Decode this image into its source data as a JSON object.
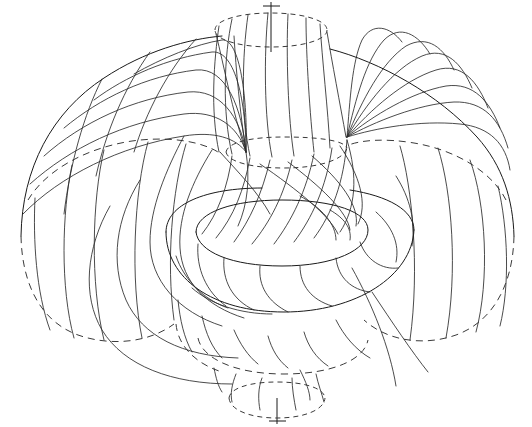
{
  "figure": {
    "kind": "mathematical-line-diagram",
    "background_color": "#ffffff",
    "line_color": "#1a1a1a",
    "dashed_line_color": "#3a3a3a",
    "canvas": {
      "width": 532,
      "height": 427
    },
    "caption": "",
    "labels": [],
    "axis": {
      "name": "axis-of-revolution",
      "orientation": "vertical",
      "x": 271,
      "top_y": 2,
      "top_end_y": 52,
      "bottom_y": 398,
      "bottom_end_y": 424,
      "tick_top": {
        "x1": 262,
        "y1": 6,
        "x2": 281,
        "y2": 6
      },
      "tick_bottom": {
        "x1": 262,
        "y1": 421,
        "x2": 281,
        "y2": 421
      }
    },
    "outer_silhouette": {
      "name": "outer-torus-outline",
      "left_extent_x": 20,
      "right_extent_x": 515,
      "top_extent_y": 14,
      "bottom_extent_y": 414,
      "solid_top_arc": "M 24 233 C 26 120 120 44 218 36 C 262 32 300 36 330 48 C 420 66 505 140 512 235",
      "dashed_left_circle": "M 24 233 C 24 300 60 336 108 338 C 150 340 180 316 186 280",
      "dashed_right_circle": "M 512 235 C 512 302 476 336 430 338 C 390 340 360 318 352 284"
    },
    "ellipses": {
      "top_hole_rim": {
        "name": "upper-hole-rim",
        "cx": 271,
        "cy": 30,
        "rx": 56,
        "ry": 17
      },
      "upper_inner_rim": {
        "name": "upper-inner-rim",
        "cx": 283,
        "cy": 152,
        "rx": 58,
        "ry": 14
      },
      "inner_torus_top": {
        "name": "inner-torus-top-rim",
        "cx": 282,
        "cy": 232,
        "rx": 88,
        "ry": 27
      },
      "inner_torus_outer": {
        "name": "inner-torus-outer-rim",
        "cx": 290,
        "cy": 248,
        "rx": 125,
        "ry": 58
      },
      "lower_inner_rim": {
        "name": "lower-inner-rim",
        "cx": 283,
        "cy": 355,
        "rx": 85,
        "ry": 22
      },
      "bottom_hole_rim": {
        "name": "lower-hole-rim",
        "cx": 277,
        "cy": 400,
        "rx": 48,
        "ry": 15
      }
    },
    "convergence_points": [
      {
        "name": "fan-node-right",
        "x": 347,
        "y": 137,
        "fan_count": 8
      },
      {
        "name": "fan-node-left",
        "x": 246,
        "y": 152,
        "fan_count": 6
      }
    ],
    "band_counts": {
      "outer_left_bands": 7,
      "outer_right_bands": 7,
      "upper_collar_bands": 8,
      "lower_collar_bands": 7,
      "inner_torus_bands": 9,
      "central_spiral_bands": 10
    },
    "elements": {
      "outer_surface": "outer-revolution-surface",
      "inner_torus": "inner-torus",
      "upper_collar": "upper-collar",
      "lower_collar": "lower-collar",
      "central_spiral": "central-spiral-bands"
    }
  }
}
